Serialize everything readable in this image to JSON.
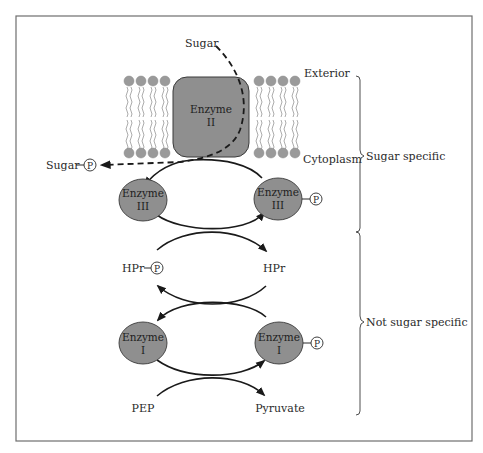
{
  "diagram": {
    "colors": {
      "frame": "#6e6e6e",
      "enzyme_fill": "#8f8f8f",
      "enzyme_stroke": "#3a3a3a",
      "lipid_head": "#9a9a9a",
      "line": "#1a1a1a",
      "text": "#2a2a2a"
    },
    "labels": {
      "sugar_in": "Sugar",
      "exterior": "Exterior",
      "cytoplasm": "Cytoplasm",
      "sugar_phosphate": "Sugar",
      "hpr_p": "HPr",
      "hpr": "HPr",
      "pep": "PEP",
      "pyruvate": "Pyruvate",
      "phosphate_symbol": "P"
    },
    "enzymes": {
      "enzyme2": {
        "line1": "Enzyme",
        "line2": "II"
      },
      "enzyme3_left": {
        "line1": "Enzyme",
        "line2": "III"
      },
      "enzyme3_right": {
        "line1": "Enzyme",
        "line2": "III"
      },
      "enzyme1_left": {
        "line1": "Enzyme",
        "line2": "I"
      },
      "enzyme1_right": {
        "line1": "Enzyme",
        "line2": "I"
      }
    },
    "brackets": {
      "sugar_specific": "Sugar specific",
      "not_sugar_specific": "Not sugar specific"
    }
  }
}
